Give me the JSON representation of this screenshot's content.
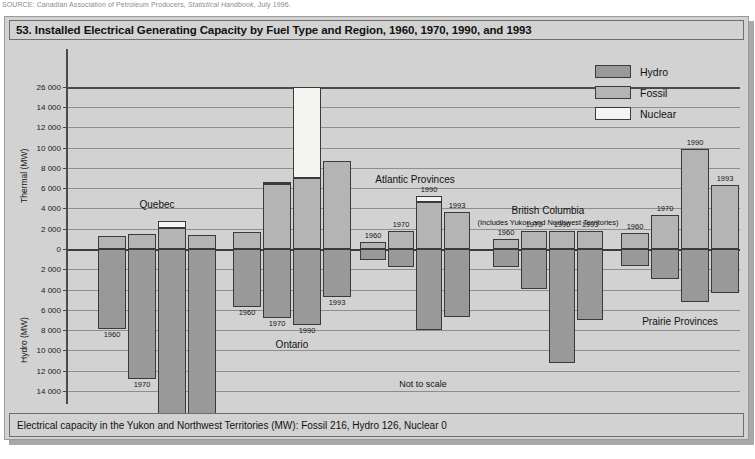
{
  "source": {
    "prefix": "SOURCE: Canadian Association of Petroleum Producers, ",
    "italic": "Statistical Handbook",
    "suffix": ", July 1996."
  },
  "title": "53. Installed Electrical Generating Capacity by Fuel Type and Region, 1960, 1970, 1990, and 1993",
  "footer_note": "Electrical capacity in the Yukon and Northwest Territories (MW): Fossil 216, Hydro 126, Nuclear 0",
  "not_to_scale": "Not to scale",
  "legend": {
    "items": [
      {
        "label": "Hydro",
        "color": "#999999",
        "key": "hydro"
      },
      {
        "label": "Fossil",
        "color": "#b4b4b4",
        "key": "fossil"
      },
      {
        "label": "Nuclear",
        "color": "#f4f4f0",
        "key": "nuclear"
      }
    ]
  },
  "axes": {
    "upper_title": "Thermal (MW)",
    "lower_title": "Hydro (MW)",
    "upper_ticks": [
      "26 000",
      "14 000",
      "12 000",
      "10 000",
      "8 000",
      "6 000",
      "4 000",
      "2 000"
    ],
    "zero_tick": "0",
    "lower_ticks": [
      "2 000",
      "4 000",
      "6 000",
      "8 000",
      "10 000",
      "12 000",
      "14 000",
      "28 000",
      "32 000"
    ]
  },
  "chart_data": {
    "type": "bar",
    "title": "53. Installed Electrical Generating Capacity by Fuel Type and Region, 1960, 1970, 1990, and 1993",
    "subtitle": "Not to scale",
    "xlabel": "",
    "ylabel_up": "Thermal (MW)",
    "ylabel_down": "Hydro (MW)",
    "ylim_up": [
      0,
      26000
    ],
    "ylim_down": [
      0,
      32000
    ],
    "grid": true,
    "legend_position": "top-right",
    "axis_breaks": [
      {
        "between": [
          14000,
          26000
        ],
        "side": "upper"
      },
      {
        "between": [
          14000,
          28000
        ],
        "side": "lower"
      }
    ],
    "series": [
      {
        "name": "Fossil",
        "color": "#b4b4b4",
        "direction": "up"
      },
      {
        "name": "Nuclear",
        "color": "#f4f4f0",
        "direction": "up"
      },
      {
        "name": "Hydro",
        "color": "#999999",
        "direction": "down"
      }
    ],
    "categories": [
      "1960",
      "1970",
      "1990",
      "1993"
    ],
    "regions": [
      {
        "name": "Quebec",
        "label_pos": "above",
        "bars": [
          {
            "year": "1960",
            "fossil": 1300,
            "nuclear": 0,
            "hydro": 7900,
            "label_side": "bottom"
          },
          {
            "year": "1970",
            "fossil": 1500,
            "nuclear": 0,
            "hydro": 12800,
            "label_side": "bottom"
          },
          {
            "year": "1990",
            "fossil": 2100,
            "nuclear": 700,
            "hydro": 26500,
            "label_side": "bottom"
          },
          {
            "year": "1993",
            "fossil": 1400,
            "nuclear": 0,
            "hydro": 31200,
            "label_side": "bottom"
          }
        ]
      },
      {
        "name": "Ontario",
        "label_pos": "below",
        "bars": [
          {
            "year": "1960",
            "fossil": 1700,
            "nuclear": 0,
            "hydro": 5700,
            "label_side": "bottom"
          },
          {
            "year": "1970",
            "fossil": 6400,
            "nuclear": 200,
            "hydro": 6800,
            "label_side": "bottom"
          },
          {
            "year": "1990",
            "fossil": 7000,
            "nuclear": 19000,
            "hydro": 7500,
            "label_side": "bottom"
          },
          {
            "year": "1993",
            "fossil": 8700,
            "nuclear": 0,
            "hydro": 4700,
            "label_side": "bottom"
          }
        ]
      },
      {
        "name": "Atlantic Provinces",
        "label_pos": "above",
        "bars": [
          {
            "year": "1960",
            "fossil": 700,
            "nuclear": 0,
            "hydro": 1100,
            "label_side": "top"
          },
          {
            "year": "1970",
            "fossil": 1800,
            "nuclear": 0,
            "hydro": 1800,
            "label_side": "top"
          },
          {
            "year": "1990",
            "fossil": 4600,
            "nuclear": 600,
            "hydro": 8000,
            "label_side": "top"
          },
          {
            "year": "1993",
            "fossil": 3600,
            "nuclear": 0,
            "hydro": 6700,
            "label_side": "top"
          }
        ]
      },
      {
        "name": "British Columbia",
        "sub": "(Includes Yukon and Northwest Territories)",
        "label_pos": "above",
        "bars": [
          {
            "year": "1960",
            "fossil": 1000,
            "nuclear": 0,
            "hydro": 1800,
            "label_side": "top"
          },
          {
            "year": "1970",
            "fossil": 1800,
            "nuclear": 0,
            "hydro": 3900,
            "label_side": "top"
          },
          {
            "year": "1990",
            "fossil": 1800,
            "nuclear": 0,
            "hydro": 11200,
            "label_side": "top"
          },
          {
            "year": "1993",
            "fossil": 1800,
            "nuclear": 0,
            "hydro": 7000,
            "label_side": "top"
          }
        ]
      },
      {
        "name": "Prairie Provinces",
        "label_pos": "below",
        "bars": [
          {
            "year": "1960",
            "fossil": 1600,
            "nuclear": 0,
            "hydro": 1700,
            "label_side": "top"
          },
          {
            "year": "1970",
            "fossil": 3400,
            "nuclear": 0,
            "hydro": 3000,
            "label_side": "top"
          },
          {
            "year": "1990",
            "fossil": 9900,
            "nuclear": 0,
            "hydro": 5200,
            "label_side": "top"
          },
          {
            "year": "1993",
            "fossil": 6300,
            "nuclear": 0,
            "hydro": 4300,
            "label_side": "top"
          }
        ]
      }
    ]
  }
}
